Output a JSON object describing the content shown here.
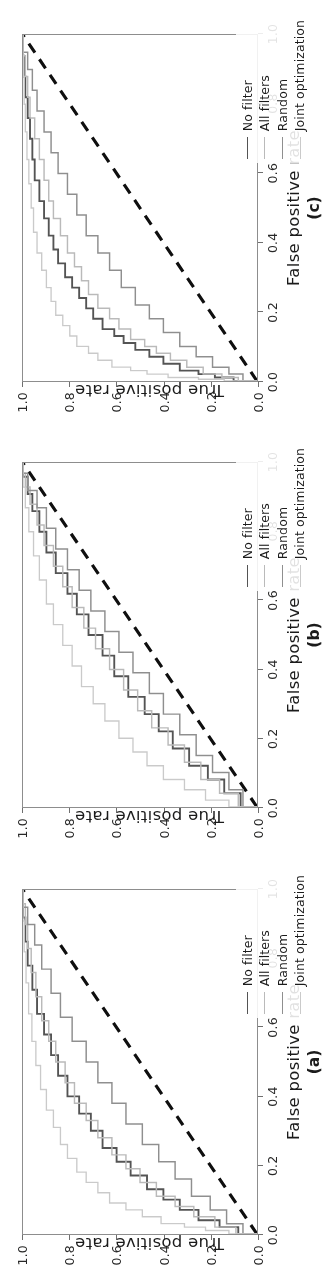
{
  "figure": {
    "title": "ROC curves for three datasets",
    "orientation": "rotated-90-ccw",
    "background": "#fdfdfb"
  },
  "axis": {
    "xlabel": "False positive rate",
    "ylabel": "True positive rate",
    "xticks": [
      "0.0",
      "0.2",
      "0.4",
      "0.6",
      "0.8",
      "1.0"
    ],
    "yticks": [
      "0.0",
      "0.2",
      "0.4",
      "0.6",
      "0.8",
      "1.0"
    ]
  },
  "legend": {
    "entries": [
      {
        "label": "No filter",
        "color": "#555555"
      },
      {
        "label": "All filters",
        "color": "#b9b9b9"
      },
      {
        "label": "Random",
        "color": "#8f8f8f"
      },
      {
        "label": "Joint optimization",
        "color": "#c9c9c9"
      }
    ]
  },
  "panels": [
    {
      "id": "panel-c",
      "label": "(c)"
    },
    {
      "id": "panel-b",
      "label": "(b)"
    },
    {
      "id": "panel-a",
      "label": "(a)"
    }
  ],
  "chart_data": [
    {
      "type": "line",
      "panel": "(c)",
      "title": "",
      "xlabel": "False positive rate",
      "ylabel": "True positive rate",
      "xlim": [
        0,
        1
      ],
      "ylim": [
        0,
        1
      ],
      "grid": false,
      "legend_position": "inner-lower-right",
      "annotations": [
        {
          "text": "chance diagonal",
          "style": "black dashed line from (0,0) to (1,1)"
        }
      ],
      "series": [
        {
          "name": "No filter",
          "color": "#555555",
          "x": [
            0.0,
            0.01,
            0.02,
            0.03,
            0.05,
            0.07,
            0.09,
            0.11,
            0.13,
            0.15,
            0.18,
            0.21,
            0.24,
            0.27,
            0.3,
            0.34,
            0.38,
            0.42,
            0.47,
            0.52,
            0.58,
            0.64,
            0.7,
            0.76,
            0.82,
            0.88,
            0.94,
            1.0
          ],
          "y": [
            0.0,
            0.1,
            0.18,
            0.25,
            0.33,
            0.4,
            0.46,
            0.52,
            0.57,
            0.61,
            0.66,
            0.7,
            0.73,
            0.76,
            0.79,
            0.82,
            0.85,
            0.87,
            0.89,
            0.91,
            0.93,
            0.95,
            0.96,
            0.97,
            0.98,
            0.99,
            0.995,
            1.0
          ]
        },
        {
          "name": "All filters",
          "color": "#b9b9b9",
          "x": [
            0.0,
            0.01,
            0.02,
            0.04,
            0.06,
            0.08,
            0.1,
            0.12,
            0.15,
            0.18,
            0.21,
            0.25,
            0.29,
            0.33,
            0.37,
            0.42,
            0.47,
            0.52,
            0.58,
            0.64,
            0.7,
            0.76,
            0.82,
            0.88,
            0.94,
            1.0
          ],
          "y": [
            0.0,
            0.08,
            0.15,
            0.23,
            0.3,
            0.37,
            0.43,
            0.48,
            0.54,
            0.59,
            0.63,
            0.68,
            0.72,
            0.75,
            0.78,
            0.81,
            0.84,
            0.87,
            0.89,
            0.91,
            0.93,
            0.95,
            0.97,
            0.98,
            0.99,
            1.0
          ]
        },
        {
          "name": "Random",
          "color": "#8f8f8f",
          "x": [
            0.0,
            0.02,
            0.04,
            0.07,
            0.1,
            0.14,
            0.18,
            0.22,
            0.27,
            0.32,
            0.37,
            0.42,
            0.48,
            0.54,
            0.6,
            0.66,
            0.72,
            0.78,
            0.84,
            0.9,
            0.95,
            1.0
          ],
          "y": [
            0.0,
            0.06,
            0.12,
            0.19,
            0.26,
            0.33,
            0.4,
            0.46,
            0.52,
            0.58,
            0.63,
            0.68,
            0.73,
            0.77,
            0.81,
            0.85,
            0.88,
            0.91,
            0.94,
            0.96,
            0.98,
            1.0
          ]
        },
        {
          "name": "Joint optimization",
          "color": "#c9c9c9",
          "x": [
            0.0,
            0.005,
            0.01,
            0.02,
            0.03,
            0.04,
            0.06,
            0.08,
            0.1,
            0.13,
            0.16,
            0.19,
            0.23,
            0.27,
            0.32,
            0.37,
            0.43,
            0.5,
            0.57,
            0.64,
            0.72,
            0.8,
            0.88,
            0.94,
            1.0
          ],
          "y": [
            0.0,
            0.14,
            0.25,
            0.38,
            0.47,
            0.54,
            0.62,
            0.68,
            0.72,
            0.77,
            0.8,
            0.83,
            0.86,
            0.88,
            0.9,
            0.92,
            0.94,
            0.955,
            0.965,
            0.975,
            0.983,
            0.99,
            0.995,
            0.998,
            1.0
          ]
        }
      ]
    },
    {
      "type": "line",
      "panel": "(b)",
      "title": "",
      "xlabel": "False positive rate",
      "ylabel": "True positive rate",
      "xlim": [
        0,
        1
      ],
      "ylim": [
        0,
        1
      ],
      "grid": false,
      "legend_position": "inner-lower-right",
      "annotations": [
        {
          "text": "chance diagonal",
          "style": "black dashed line from (0,0) to (1,1)"
        }
      ],
      "series": [
        {
          "name": "No filter",
          "color": "#555555",
          "x": [
            0.0,
            0.04,
            0.08,
            0.12,
            0.17,
            0.22,
            0.27,
            0.32,
            0.38,
            0.44,
            0.5,
            0.56,
            0.62,
            0.68,
            0.74,
            0.8,
            0.86,
            0.91,
            0.96,
            1.0
          ],
          "y": [
            0.0,
            0.07,
            0.14,
            0.21,
            0.29,
            0.36,
            0.42,
            0.48,
            0.55,
            0.61,
            0.66,
            0.72,
            0.77,
            0.81,
            0.86,
            0.9,
            0.93,
            0.96,
            0.98,
            1.0
          ]
        },
        {
          "name": "All filters",
          "color": "#b9b9b9",
          "x": [
            0.0,
            0.04,
            0.08,
            0.13,
            0.18,
            0.23,
            0.28,
            0.34,
            0.4,
            0.46,
            0.52,
            0.58,
            0.64,
            0.7,
            0.76,
            0.82,
            0.88,
            0.93,
            0.97,
            1.0
          ],
          "y": [
            0.0,
            0.08,
            0.16,
            0.24,
            0.31,
            0.38,
            0.45,
            0.51,
            0.57,
            0.63,
            0.69,
            0.74,
            0.79,
            0.83,
            0.87,
            0.91,
            0.94,
            0.97,
            0.99,
            1.0
          ]
        },
        {
          "name": "Random",
          "color": "#8f8f8f",
          "x": [
            0.0,
            0.05,
            0.1,
            0.15,
            0.21,
            0.27,
            0.33,
            0.39,
            0.45,
            0.51,
            0.57,
            0.63,
            0.69,
            0.75,
            0.81,
            0.87,
            0.92,
            0.97,
            1.0
          ],
          "y": [
            0.0,
            0.06,
            0.12,
            0.19,
            0.26,
            0.33,
            0.4,
            0.46,
            0.53,
            0.59,
            0.65,
            0.71,
            0.76,
            0.81,
            0.86,
            0.9,
            0.94,
            0.98,
            1.0
          ]
        },
        {
          "name": "Joint optimization",
          "color": "#c9c9c9",
          "x": [
            0.0,
            0.02,
            0.05,
            0.08,
            0.12,
            0.16,
            0.2,
            0.25,
            0.3,
            0.35,
            0.41,
            0.47,
            0.53,
            0.59,
            0.66,
            0.73,
            0.8,
            0.87,
            0.93,
            1.0
          ],
          "y": [
            0.0,
            0.12,
            0.22,
            0.31,
            0.4,
            0.47,
            0.53,
            0.59,
            0.65,
            0.7,
            0.75,
            0.79,
            0.83,
            0.87,
            0.9,
            0.93,
            0.955,
            0.975,
            0.99,
            1.0
          ]
        }
      ]
    },
    {
      "type": "line",
      "panel": "(a)",
      "title": "",
      "xlabel": "False positive rate",
      "ylabel": "True positive rate",
      "xlim": [
        0,
        1
      ],
      "ylim": [
        0,
        1
      ],
      "grid": false,
      "legend_position": "inner-lower-right",
      "annotations": [
        {
          "text": "chance diagonal",
          "style": "black dashed line from (0,0) to (1,1)"
        }
      ],
      "series": [
        {
          "name": "No filter",
          "color": "#555555",
          "x": [
            0.0,
            0.02,
            0.04,
            0.07,
            0.1,
            0.13,
            0.17,
            0.21,
            0.25,
            0.3,
            0.35,
            0.4,
            0.46,
            0.52,
            0.58,
            0.64,
            0.71,
            0.78,
            0.85,
            0.92,
            1.0
          ],
          "y": [
            0.0,
            0.08,
            0.16,
            0.25,
            0.33,
            0.4,
            0.47,
            0.54,
            0.6,
            0.66,
            0.71,
            0.76,
            0.81,
            0.85,
            0.88,
            0.91,
            0.94,
            0.96,
            0.98,
            0.99,
            1.0
          ]
        },
        {
          "name": "All filters",
          "color": "#b9b9b9",
          "x": [
            0.0,
            0.02,
            0.05,
            0.08,
            0.11,
            0.15,
            0.19,
            0.23,
            0.28,
            0.33,
            0.38,
            0.44,
            0.5,
            0.56,
            0.62,
            0.69,
            0.76,
            0.83,
            0.9,
            0.96,
            1.0
          ],
          "y": [
            0.0,
            0.09,
            0.18,
            0.27,
            0.35,
            0.43,
            0.5,
            0.56,
            0.62,
            0.68,
            0.73,
            0.78,
            0.82,
            0.86,
            0.89,
            0.92,
            0.945,
            0.965,
            0.98,
            0.99,
            1.0
          ]
        },
        {
          "name": "Random",
          "color": "#8f8f8f",
          "x": [
            0.0,
            0.03,
            0.07,
            0.11,
            0.16,
            0.21,
            0.26,
            0.32,
            0.38,
            0.44,
            0.5,
            0.56,
            0.63,
            0.7,
            0.77,
            0.84,
            0.9,
            0.95,
            1.0
          ],
          "y": [
            0.0,
            0.06,
            0.13,
            0.2,
            0.28,
            0.35,
            0.42,
            0.49,
            0.56,
            0.62,
            0.68,
            0.73,
            0.79,
            0.84,
            0.88,
            0.92,
            0.95,
            0.98,
            1.0
          ]
        },
        {
          "name": "Joint optimization",
          "color": "#c9c9c9",
          "x": [
            0.0,
            0.01,
            0.02,
            0.03,
            0.05,
            0.07,
            0.09,
            0.12,
            0.15,
            0.18,
            0.22,
            0.26,
            0.31,
            0.36,
            0.42,
            0.49,
            0.56,
            0.64,
            0.73,
            0.82,
            0.91,
            1.0
          ],
          "y": [
            0.0,
            0.12,
            0.22,
            0.31,
            0.41,
            0.49,
            0.56,
            0.63,
            0.68,
            0.73,
            0.77,
            0.81,
            0.84,
            0.87,
            0.9,
            0.925,
            0.945,
            0.962,
            0.976,
            0.987,
            0.995,
            1.0
          ]
        }
      ]
    }
  ]
}
